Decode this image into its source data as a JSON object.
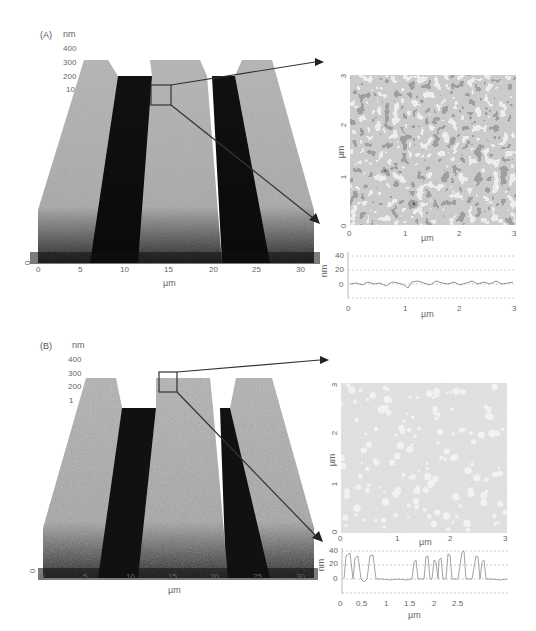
{
  "figure": {
    "panels": [
      {
        "label": "(A)",
        "surface3d": {
          "z_unit": "nm",
          "z_ticks": [
            "400",
            "300",
            "200",
            "10"
          ],
          "z_zero": "0",
          "x_ticks": [
            "0",
            "5",
            "10",
            "15",
            "20",
            "25",
            "30"
          ],
          "x_label": "µm",
          "texture": "smooth"
        },
        "afm_image": {
          "x_ticks": [
            "0",
            "1",
            "2",
            "3"
          ],
          "y_ticks": [
            "0",
            "1",
            "2",
            "3"
          ],
          "x_label": "µm",
          "y_label": "µm",
          "morphology": "fine-grained continuous film"
        },
        "profile": {
          "y_ticks": [
            "40",
            "20",
            "0"
          ],
          "y_label": "nm",
          "x_ticks": [
            "0",
            "1",
            "2",
            "3"
          ],
          "x_label": "µm"
        }
      },
      {
        "label": "(B)",
        "surface3d": {
          "z_unit": "nm",
          "z_ticks": [
            "400",
            "300",
            "200",
            "1"
          ],
          "z_zero": "0",
          "x_ticks": [
            "0",
            "5",
            "10",
            "15",
            "20",
            "25",
            "30"
          ],
          "x_label": "µm",
          "texture": "rough"
        },
        "afm_image": {
          "x_ticks": [
            "0",
            "1",
            "2",
            "3"
          ],
          "y_ticks": [
            "0",
            "1",
            "2",
            "3"
          ],
          "x_label": "µm",
          "y_label": "µm",
          "morphology": "isolated bright islands on gray background"
        },
        "profile": {
          "y_ticks": [
            "40",
            "20",
            "0"
          ],
          "y_label": "nm",
          "x_ticks": [
            "0",
            "0.5",
            "1",
            "1.5",
            "2",
            "2.5"
          ],
          "x_label": "µm"
        }
      }
    ]
  },
  "chart_data": [
    {
      "type": "line",
      "title": "(A) line profile",
      "xlabel": "µm",
      "ylabel": "nm",
      "xlim": [
        0,
        3
      ],
      "ylim": [
        -10,
        45
      ],
      "x": [
        0,
        0.25,
        0.5,
        0.75,
        1.0,
        1.25,
        1.5,
        1.75,
        2.0,
        2.25,
        2.5,
        2.75,
        3.0
      ],
      "series": [
        {
          "name": "height",
          "values": [
            0,
            1,
            0,
            -2,
            1,
            2,
            0,
            1,
            0,
            2,
            1,
            0,
            1
          ]
        }
      ],
      "grid": true
    },
    {
      "type": "line",
      "title": "(B) line profile",
      "xlabel": "µm",
      "ylabel": "nm",
      "xlim": [
        0,
        3
      ],
      "ylim": [
        -10,
        45
      ],
      "x": [
        0.05,
        0.15,
        0.25,
        0.35,
        0.5,
        0.8,
        1.1,
        1.3,
        1.45,
        1.55,
        1.7,
        1.9,
        2.1,
        2.3,
        2.5,
        2.6,
        2.75,
        2.9
      ],
      "series": [
        {
          "name": "height",
          "values": [
            35,
            30,
            28,
            32,
            0,
            0,
            22,
            30,
            25,
            28,
            0,
            35,
            0,
            40,
            0,
            30,
            22,
            0
          ]
        }
      ],
      "grid": true
    }
  ]
}
